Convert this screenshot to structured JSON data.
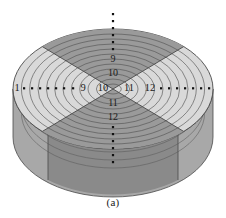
{
  "figure": {
    "caption": "(a)",
    "type": "3d-cylinder-sector-diagram",
    "background_color": "#ffffff"
  },
  "colors": {
    "top_wedge_dark": "#9a9a9a",
    "side_wedge_light": "#d9d9d9",
    "wall_front_dark": "#8a8a8a",
    "wall_side_mid": "#a8a8a8",
    "ring_line": "#555555",
    "divider_line": "#4a4a4a",
    "label_color": "#1a1a1a",
    "dot_color": "#111111"
  },
  "labels": {
    "center_row": [
      {
        "text": "9",
        "x": 83,
        "y": 89
      },
      {
        "text": "10",
        "x": 103,
        "y": 89
      },
      {
        "text": "11",
        "x": 129,
        "y": 89
      },
      {
        "text": "12",
        "x": 150,
        "y": 89
      }
    ],
    "vertical_column": [
      {
        "text": "9",
        "x": 113,
        "y": 60
      },
      {
        "text": "10",
        "x": 113,
        "y": 74
      },
      {
        "text": "11",
        "x": 113,
        "y": 104
      },
      {
        "text": "12",
        "x": 113,
        "y": 118
      }
    ],
    "left_end": {
      "text": "1",
      "x": 17,
      "y": 89
    }
  },
  "ellipsis": {
    "left_axis_dots": 9,
    "right_axis_dots": 9,
    "top_axis_dots": 7,
    "bottom_axis_dots": 7
  },
  "geometry": {
    "rings_count": 12,
    "wedges_count": 4,
    "center_x": 113,
    "center_y": 89,
    "top_radius_x": 100,
    "top_radius_y": 60,
    "cylinder_height": 48
  }
}
